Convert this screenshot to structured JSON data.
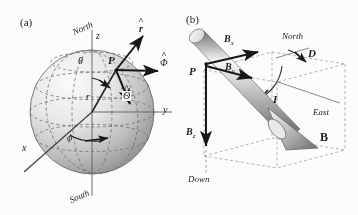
{
  "figure": {
    "caption_panels": [
      "(a)",
      "(b)"
    ],
    "background_color": "#fdfdfd",
    "ink_color": "#1a1a1a"
  },
  "panel_a": {
    "id": "(a)",
    "description": "Sphere with spherical coordinate system",
    "sphere": {
      "center_x": 92,
      "center_y": 112,
      "radius": 62,
      "fill_light": "#f2f2f2",
      "fill_dark": "#9a9a9a",
      "grid_style": "dashed"
    },
    "labels": {
      "north": "North",
      "south": "South",
      "axis_z": "z",
      "axis_y": "y",
      "axis_x": "x",
      "point": "P",
      "theta": "θ",
      "phi": "ϕ",
      "radius": "r",
      "unit_r": "r",
      "unit_phi": "Φ",
      "unit_theta": "Θ"
    },
    "vectors": [
      {
        "name": "r-hat",
        "label": "r",
        "hat": true,
        "direction": "radially outward"
      },
      {
        "name": "phi-hat",
        "label": "Φ",
        "hat": true,
        "direction": "eastward"
      },
      {
        "name": "theta-hat",
        "label": "Θ",
        "hat": true,
        "direction": "southward"
      },
      {
        "name": "radius-line",
        "label": "r",
        "hat": false,
        "direction": "center to P"
      }
    ]
  },
  "panel_b": {
    "id": "(b)",
    "description": "Geomagnetic field vector B decomposed into components",
    "labels": {
      "point": "P",
      "field_vector": "B",
      "component_x": "B",
      "component_x_sub": "x",
      "component_y": "B",
      "component_y_sub": "y",
      "component_z": "B",
      "component_z_sub": "z",
      "declination": "D",
      "inclination": "I",
      "north": "North",
      "east": "East",
      "down": "Down"
    },
    "vectors": [
      {
        "name": "B-total",
        "label": "B",
        "bold": true,
        "style": "3d-cone-arrow"
      },
      {
        "name": "Bx",
        "label": "Bx",
        "direction": "north"
      },
      {
        "name": "By",
        "label": "By",
        "direction": "east"
      },
      {
        "name": "Bz",
        "label": "Bz",
        "direction": "down"
      }
    ],
    "angles": [
      {
        "name": "declination",
        "symbol": "D",
        "between": "North and horizontal projection"
      },
      {
        "name": "inclination",
        "symbol": "I",
        "between": "horizontal plane and B"
      }
    ],
    "box_style": "dashed-wireframe"
  }
}
